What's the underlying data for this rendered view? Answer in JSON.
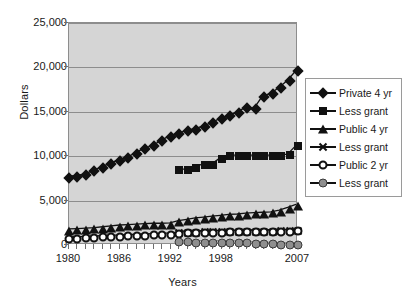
{
  "chart_data": {
    "type": "line",
    "title": "",
    "xlabel": "Years",
    "ylabel": "Dollars",
    "xlim": [
      1980,
      2007
    ],
    "ylim": [
      0,
      25000
    ],
    "ytick_labels": [
      "0",
      "5,000",
      "10,000",
      "15,000",
      "20,000",
      "25,000"
    ],
    "ytick_values": [
      0,
      5000,
      10000,
      15000,
      20000,
      25000
    ],
    "xtick_labels": [
      "1980",
      "1986",
      "1992",
      "1998",
      "2007"
    ],
    "xtick_values": [
      1980,
      1986,
      1992,
      1998,
      2007
    ],
    "grid": "horizontal",
    "legend_position": "right",
    "plot_background": "#d5d5d5",
    "x": [
      1980,
      1981,
      1982,
      1983,
      1984,
      1985,
      1986,
      1987,
      1988,
      1989,
      1990,
      1991,
      1992,
      1993,
      1994,
      1995,
      1996,
      1997,
      1998,
      1999,
      2000,
      2001,
      2002,
      2003,
      2004,
      2005,
      2006,
      2007
    ],
    "series": [
      {
        "name": "Private 4 yr",
        "marker": "filled-diamond",
        "color": "#111111",
        "values": [
          7600,
          7700,
          7900,
          8300,
          8700,
          9100,
          9500,
          9800,
          10300,
          10800,
          11100,
          11700,
          12200,
          12500,
          12800,
          13000,
          13300,
          13700,
          14200,
          14500,
          14900,
          15400,
          15300,
          16700,
          17000,
          17700,
          18500,
          19600
        ]
      },
      {
        "name": "Less grant",
        "marker": "filled-square",
        "color": "#111111",
        "values": [
          null,
          null,
          null,
          null,
          null,
          null,
          null,
          null,
          null,
          null,
          null,
          null,
          null,
          8400,
          8400,
          8700,
          9000,
          9000,
          9700,
          10000,
          10000,
          10000,
          10000,
          10000,
          10000,
          10000,
          10100,
          11100
        ]
      },
      {
        "name": "Public 4 yr",
        "marker": "filled-triangle",
        "color": "#111111",
        "values": [
          1600,
          1650,
          1700,
          1750,
          1850,
          1950,
          2050,
          2100,
          2150,
          2200,
          2250,
          2250,
          2300,
          2550,
          2700,
          2850,
          2950,
          3050,
          3150,
          3250,
          3300,
          3400,
          3450,
          3500,
          3550,
          3750,
          4050,
          4400
        ]
      },
      {
        "name": "Less grant",
        "marker": "x-star",
        "color": "#111111",
        "values": [
          null,
          null,
          null,
          null,
          null,
          null,
          null,
          null,
          null,
          null,
          null,
          null,
          null,
          1350,
          1380,
          1400,
          1420,
          1430,
          1450,
          1470,
          1480,
          1490,
          1500,
          1500,
          1520,
          1540,
          1560,
          1600
        ]
      },
      {
        "name": "Public 2 yr",
        "marker": "open-circle",
        "color": "#111111",
        "values": [
          700,
          730,
          760,
          800,
          850,
          880,
          920,
          960,
          1000,
          1030,
          1070,
          1100,
          1150,
          1250,
          1300,
          1330,
          1350,
          1380,
          1400,
          1420,
          1430,
          1450,
          1460,
          1470,
          1480,
          1490,
          1500,
          1550
        ]
      },
      {
        "name": "Less grant",
        "marker": "gray-circle",
        "color": "#8f8f8f",
        "values": [
          null,
          null,
          null,
          null,
          null,
          null,
          null,
          null,
          null,
          null,
          null,
          null,
          null,
          300,
          300,
          280,
          280,
          270,
          260,
          250,
          240,
          230,
          130,
          100,
          60,
          40,
          20,
          0
        ]
      }
    ]
  },
  "legend": {
    "items": [
      {
        "label": "Private 4 yr",
        "marker": "filled-diamond"
      },
      {
        "label": "Less grant",
        "marker": "filled-square"
      },
      {
        "label": "Public 4 yr",
        "marker": "filled-triangle"
      },
      {
        "label": "Less grant",
        "marker": "x-star"
      },
      {
        "label": "Public 2 yr",
        "marker": "open-circle"
      },
      {
        "label": "Less grant",
        "marker": "gray-circle"
      }
    ]
  }
}
